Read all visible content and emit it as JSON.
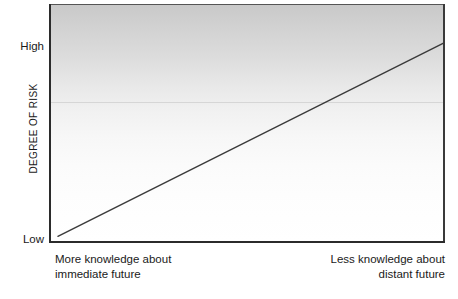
{
  "chart_data": {
    "type": "line",
    "title": "",
    "subtitle": "",
    "ylabel": "DEGREE OF RISK",
    "xlabel": "",
    "ytick_labels": [
      "High",
      "Low"
    ],
    "xtick_labels": [],
    "grid": false,
    "legend": null,
    "xlim": [
      0,
      1
    ],
    "ylim": [
      0,
      1
    ],
    "annotations": {
      "x_left_line1": "More knowledge about",
      "x_left_line2": "immediate future",
      "x_right_line1": "Less knowledge about",
      "x_right_line2": "distant future"
    },
    "series": [
      {
        "name": "Degree of risk",
        "x": [
          0.02,
          1.0
        ],
        "y": [
          0.02,
          0.84
        ],
        "points": [
          {
            "x": 0.02,
            "y": 0.02
          },
          {
            "x": 0.26,
            "y": 0.22
          },
          {
            "x": 0.5,
            "y": 0.43
          },
          {
            "x": 0.74,
            "y": 0.63
          },
          {
            "x": 1.0,
            "y": 0.84
          }
        ],
        "color": "#3a3a3a",
        "style": "solid",
        "width": 1.4
      }
    ],
    "plot_background": {
      "type": "vertical-gradient",
      "top_color": "#c9c9c9",
      "bottom_color": "#ffffff"
    },
    "axis_color": "#2b2b2b"
  },
  "axes": {
    "y_title": "DEGREE OF RISK",
    "y_high": "High",
    "y_low": "Low"
  },
  "captions": {
    "left_line1": "More knowledge about",
    "left_line2": "immediate future",
    "right_line1": "Less knowledge about",
    "right_line2": "distant future"
  },
  "colors": {
    "line": "#3a3a3a",
    "axis": "#2b2b2b",
    "text": "#1a1a1a",
    "gradient_top": "#c9c9c9",
    "gradient_bottom": "#ffffff"
  }
}
